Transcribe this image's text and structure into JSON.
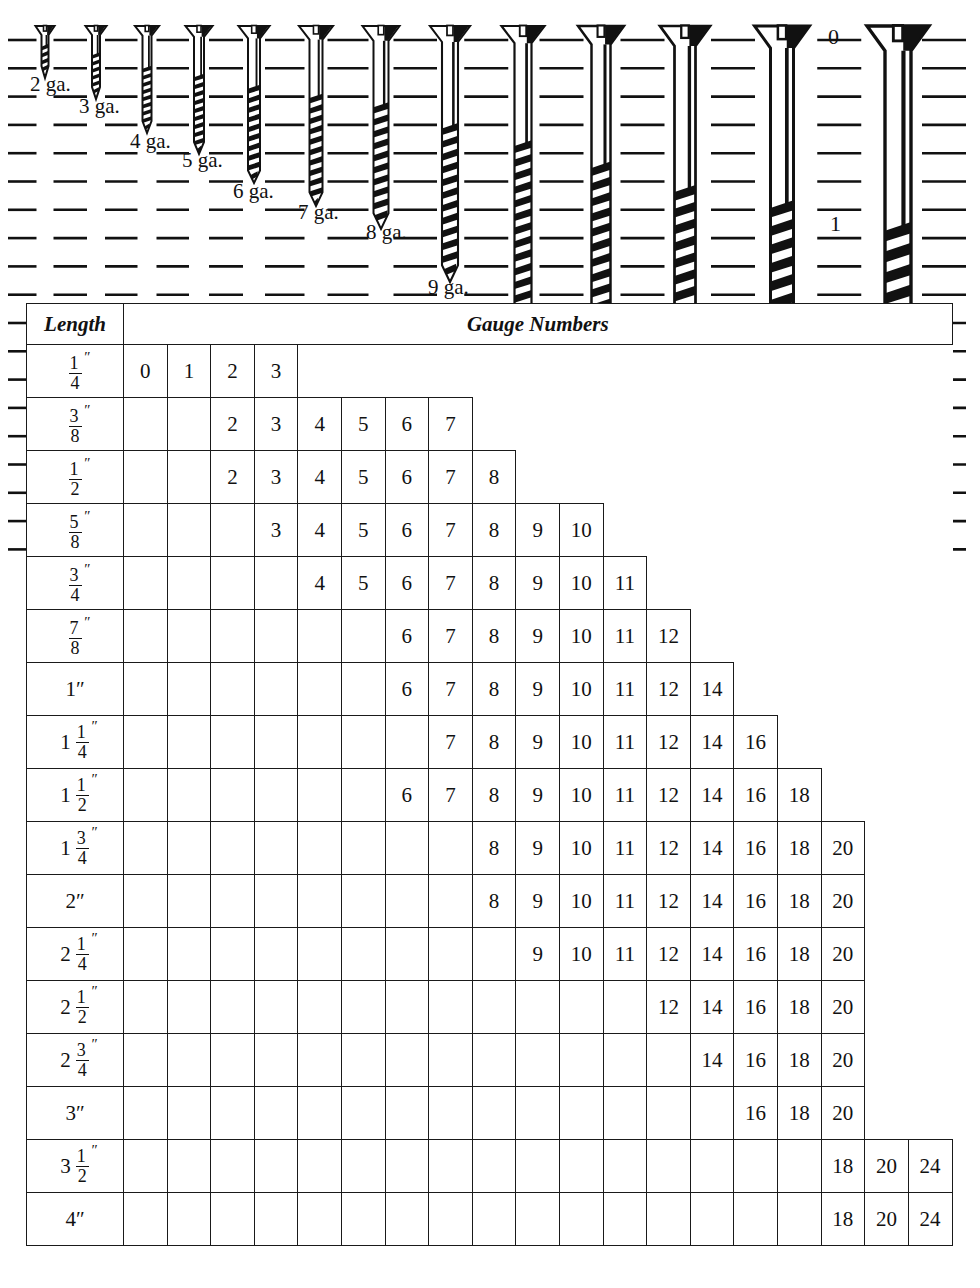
{
  "diagram": {
    "title_hidden": "Wood screw actual-size gauge comparison",
    "screw_labels": [
      {
        "text": "2 ga.",
        "x": 30,
        "y": 74
      },
      {
        "text": "3 ga.",
        "x": 79,
        "y": 96
      },
      {
        "text": "4 ga.",
        "x": 130,
        "y": 131
      },
      {
        "text": "5 ga.",
        "x": 182,
        "y": 150
      },
      {
        "text": "6 ga.",
        "x": 233,
        "y": 181
      },
      {
        "text": "7 ga.",
        "x": 298,
        "y": 202
      },
      {
        "text": "8 ga.",
        "x": 366,
        "y": 222
      },
      {
        "text": "9 ga.",
        "x": 428,
        "y": 277
      },
      {
        "text": "10 ga.",
        "x": 495,
        "y": 320
      },
      {
        "text": "11 ga.",
        "x": 580,
        "y": 373
      },
      {
        "text": "12 ga.",
        "x": 665,
        "y": 434
      },
      {
        "text": "14 ga.",
        "x": 763,
        "y": 474
      },
      {
        "text": "16 ga.",
        "x": 877,
        "y": 528
      }
    ],
    "ruler_marks": [
      {
        "text": "0",
        "x": 828,
        "y": 26
      },
      {
        "text": "1",
        "x": 830,
        "y": 213
      }
    ],
    "ruler_mixed_marks": [
      {
        "whole": "2",
        "num": "",
        "den": "",
        "x": 828,
        "y": 410
      },
      {
        "whole": "2",
        "num": "1",
        "den": "2",
        "x": 806,
        "y": 505
      }
    ],
    "screws": [
      {
        "gauge": "2",
        "x": 45,
        "head_w": 19,
        "shank_w": 7,
        "length": 52
      },
      {
        "gauge": "3",
        "x": 96,
        "head_w": 21,
        "shank_w": 8,
        "length": 73
      },
      {
        "gauge": "4",
        "x": 147,
        "head_w": 24,
        "shank_w": 9,
        "length": 107
      },
      {
        "gauge": "5",
        "x": 199,
        "head_w": 27,
        "shank_w": 10,
        "length": 128
      },
      {
        "gauge": "6",
        "x": 254,
        "head_w": 31,
        "shank_w": 12,
        "length": 157
      },
      {
        "gauge": "7",
        "x": 316,
        "head_w": 34,
        "shank_w": 13,
        "length": 180
      },
      {
        "gauge": "8",
        "x": 381,
        "head_w": 37,
        "shank_w": 15,
        "length": 203
      },
      {
        "gauge": "9",
        "x": 450,
        "head_w": 40,
        "shank_w": 16,
        "length": 256
      },
      {
        "gauge": "10",
        "x": 523,
        "head_w": 43,
        "shank_w": 17,
        "length": 300
      },
      {
        "gauge": "11",
        "x": 601,
        "head_w": 46,
        "shank_w": 19,
        "length": 355
      },
      {
        "gauge": "12",
        "x": 685,
        "head_w": 50,
        "shank_w": 21,
        "length": 415
      },
      {
        "gauge": "14",
        "x": 782,
        "head_w": 55,
        "shank_w": 23,
        "length": 455
      },
      {
        "gauge": "16",
        "x": 898,
        "head_w": 62,
        "shank_w": 26,
        "length": 512
      }
    ]
  },
  "table": {
    "header": {
      "length_label": "Length",
      "gauge_label": "Gauge Numbers"
    },
    "column_count": 19,
    "rows": [
      {
        "length": {
          "whole": "",
          "num": "1",
          "den": "4"
        },
        "start": 0,
        "values": [
          "0",
          "1",
          "2",
          "3"
        ]
      },
      {
        "length": {
          "whole": "",
          "num": "3",
          "den": "8"
        },
        "start": 2,
        "values": [
          "2",
          "3",
          "4",
          "5",
          "6",
          "7"
        ]
      },
      {
        "length": {
          "whole": "",
          "num": "1",
          "den": "2"
        },
        "start": 2,
        "values": [
          "2",
          "3",
          "4",
          "5",
          "6",
          "7",
          "8"
        ]
      },
      {
        "length": {
          "whole": "",
          "num": "5",
          "den": "8"
        },
        "start": 3,
        "values": [
          "3",
          "4",
          "5",
          "6",
          "7",
          "8",
          "9",
          "10"
        ]
      },
      {
        "length": {
          "whole": "",
          "num": "3",
          "den": "4"
        },
        "start": 4,
        "values": [
          "4",
          "5",
          "6",
          "7",
          "8",
          "9",
          "10",
          "11"
        ]
      },
      {
        "length": {
          "whole": "",
          "num": "7",
          "den": "8"
        },
        "start": 6,
        "values": [
          "6",
          "7",
          "8",
          "9",
          "10",
          "11",
          "12"
        ]
      },
      {
        "length": {
          "plain": "1″"
        },
        "start": 6,
        "values": [
          "6",
          "7",
          "8",
          "9",
          "10",
          "11",
          "12",
          "14"
        ]
      },
      {
        "length": {
          "whole": "1",
          "num": "1",
          "den": "4"
        },
        "start": 7,
        "values": [
          "7",
          "8",
          "9",
          "10",
          "11",
          "12",
          "14",
          "16"
        ]
      },
      {
        "length": {
          "whole": "1",
          "num": "1",
          "den": "2"
        },
        "start": 6,
        "values": [
          "6",
          "7",
          "8",
          "9",
          "10",
          "11",
          "12",
          "14",
          "16",
          "18"
        ]
      },
      {
        "length": {
          "whole": "1",
          "num": "3",
          "den": "4"
        },
        "start": 8,
        "values": [
          "8",
          "9",
          "10",
          "11",
          "12",
          "14",
          "16",
          "18",
          "20"
        ]
      },
      {
        "length": {
          "plain": "2″"
        },
        "start": 8,
        "values": [
          "8",
          "9",
          "10",
          "11",
          "12",
          "14",
          "16",
          "18",
          "20"
        ]
      },
      {
        "length": {
          "whole": "2",
          "num": "1",
          "den": "4"
        },
        "start": 9,
        "values": [
          "9",
          "10",
          "11",
          "12",
          "14",
          "16",
          "18",
          "20"
        ]
      },
      {
        "length": {
          "whole": "2",
          "num": "1",
          "den": "2"
        },
        "start": 12,
        "values": [
          "12",
          "14",
          "16",
          "18",
          "20"
        ]
      },
      {
        "length": {
          "whole": "2",
          "num": "3",
          "den": "4"
        },
        "start": 13,
        "values": [
          "14",
          "16",
          "18",
          "20"
        ]
      },
      {
        "length": {
          "plain": "3″"
        },
        "start": 14,
        "values": [
          "16",
          "18",
          "20"
        ]
      },
      {
        "length": {
          "whole": "3",
          "num": "1",
          "den": "2"
        },
        "start": 16,
        "values": [
          "18",
          "20",
          "24"
        ]
      },
      {
        "length": {
          "plain": "4″"
        },
        "start": 16,
        "values": [
          "18",
          "20",
          "24"
        ]
      }
    ]
  },
  "colors": {
    "ink": "#111111",
    "rule": "#1a1a1a",
    "paper": "#ffffff"
  }
}
